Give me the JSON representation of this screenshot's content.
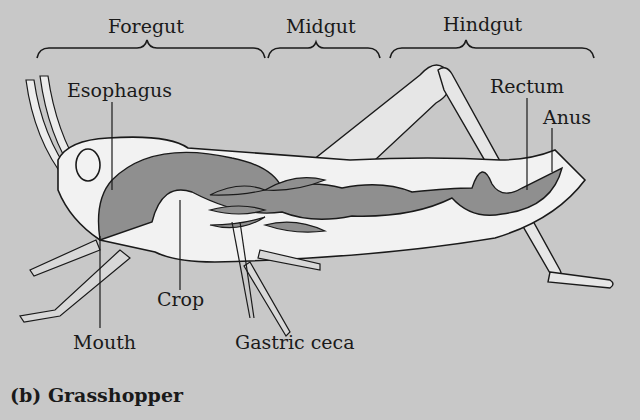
{
  "sections": {
    "foregut": "Foregut",
    "midgut": "Midgut",
    "hindgut": "Hindgut"
  },
  "labels": {
    "esophagus": "Esophagus",
    "rectum": "Rectum",
    "anus": "Anus",
    "crop": "Crop",
    "mouth": "Mouth",
    "gastric_ceca": "Gastric ceca"
  },
  "caption": "(b) Grasshopper",
  "colors": {
    "background": "#c8c8c8",
    "body": "#f2f2f2",
    "gut": "#8f8f8f",
    "outline": "#1a1a1a"
  }
}
